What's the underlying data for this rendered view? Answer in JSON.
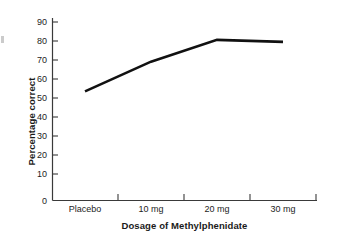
{
  "chart_data": {
    "type": "line",
    "title": "",
    "xlabel": "Dosage of Methylphenidate",
    "ylabel": "Percentage correct",
    "categories": [
      "Placebo",
      "10 mg",
      "20 mg",
      "30 mg"
    ],
    "values": [
      55,
      70,
      81,
      80
    ],
    "series": [
      {
        "name": "Percentage correct",
        "values": [
          55,
          70,
          81,
          80
        ],
        "color": "#111111"
      }
    ],
    "ylim": [
      0,
      90
    ],
    "ytick_values": [
      0,
      10,
      20,
      30,
      40,
      50,
      60,
      70,
      80,
      90
    ],
    "ytick_labels": [
      "0",
      "10",
      "20",
      "30",
      "40",
      "50",
      "60",
      "70",
      "80",
      "90"
    ],
    "xtick_labels": [
      "Placebo",
      "10 mg",
      "20 mg",
      "30 mg"
    ],
    "grid": false,
    "legend": false,
    "legend_position": "none",
    "axis_color": "#3a3a3a",
    "background_color": "#ffffff",
    "text_color": "#1a1a1a"
  }
}
